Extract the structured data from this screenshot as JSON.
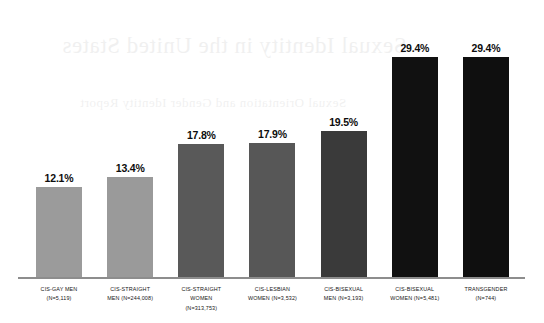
{
  "chart_data": {
    "type": "bar",
    "title": "",
    "xlabel": "",
    "ylabel": "",
    "ylim": [
      0,
      33
    ],
    "grid": false,
    "legend": "none",
    "orientation": "vertical",
    "categories": [
      "CIS-GAY MEN (N=5,119)",
      "CIS-STRAIGHT MEN (N=244,008)",
      "CIS-STRAIGHT WOMEN (N=313,753)",
      "CIS-LESBIAN WOMEN (N=3,532)",
      "CIS-BISEXUAL MEN (N=3,193)",
      "CIS-BISEXUAL WOMEN (N=5,481)",
      "TRANSGENDER (N=744)"
    ],
    "values": [
      12.1,
      13.4,
      17.8,
      17.9,
      19.5,
      29.4,
      29.4
    ],
    "value_labels": [
      "12.1%",
      "13.4%",
      "17.8%",
      "17.9%",
      "19.5%",
      "29.4%",
      "29.4%"
    ],
    "sample_sizes": [
      5119,
      244008,
      313753,
      3532,
      3193,
      5481,
      744
    ],
    "bar_colors": [
      "#9b9b9b",
      "#9a9a9a",
      "#595959",
      "#575757",
      "#3a3a3a",
      "#111111",
      "#0f0f0f"
    ],
    "bars": [
      {
        "value_label": "12.1%",
        "value": 12.1,
        "color": "#9b9b9b",
        "label_lines": [
          "CIS-GAY MEN",
          "(N=5,119)"
        ]
      },
      {
        "value_label": "13.4%",
        "value": 13.4,
        "color": "#9a9a9a",
        "label_lines": [
          "CIS-STRAIGHT",
          "MEN (N=244,008)"
        ]
      },
      {
        "value_label": "17.8%",
        "value": 17.8,
        "color": "#595959",
        "label_lines": [
          "CIS-STRAIGHT",
          "WOMEN",
          "(N=313,753)"
        ]
      },
      {
        "value_label": "17.9%",
        "value": 17.9,
        "color": "#575757",
        "label_lines": [
          "CIS-LESBIAN",
          "WOMEN (N=3,532)"
        ]
      },
      {
        "value_label": "19.5%",
        "value": 19.5,
        "color": "#3a3a3a",
        "label_lines": [
          "CIS-BISEXUAL",
          "MEN (N=3,193)"
        ]
      },
      {
        "value_label": "29.4%",
        "value": 29.4,
        "color": "#111111",
        "label_lines": [
          "CIS-BISEXUAL",
          "WOMEN (N=5,481)"
        ]
      },
      {
        "value_label": "29.4%",
        "value": 29.4,
        "color": "#0f0f0f",
        "label_lines": [
          "TRANSGENDER",
          "(N=744)"
        ]
      }
    ]
  },
  "artifacts": {
    "showthrough_line1": "Sexual Identity in the United States",
    "showthrough_line2": "Sexual Orientation and Gender Identity Report"
  },
  "colors": {
    "baseline": "#8d8d8d",
    "value_text": "#0d0d0d",
    "label_text": "#161616",
    "background": "#ffffff"
  }
}
